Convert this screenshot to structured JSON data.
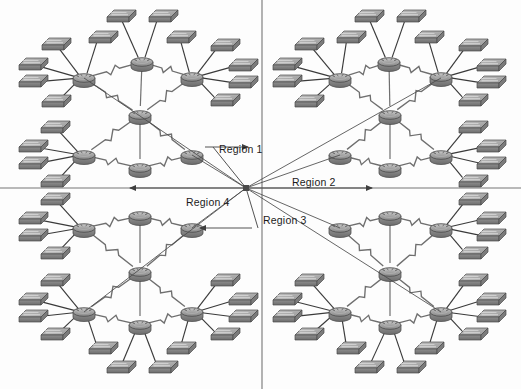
{
  "diagram": {
    "type": "network-topology",
    "width": 521,
    "height": 389,
    "background_color": "#fdfdfd",
    "colors": {
      "device_fill": "#8d8d8d",
      "device_fill_light": "#b4b4b4",
      "device_fill_dark": "#6e6e6e",
      "device_outline": "#4a4a4a",
      "lan_link": "#3a3a3a",
      "wan_link": "#6f6f6f",
      "divider": "#767676",
      "region_arrow": "#4a4a4a",
      "label_text": "#1b1b1b"
    },
    "dividers": {
      "vertical_x": 262,
      "horizontal_y": 188
    },
    "hub": {
      "x": 246,
      "y": 188
    }
  },
  "labels": {
    "region_1": "Region 1",
    "region_2": "Region 2",
    "region_3": "Region 3",
    "region_4": "Region 4"
  },
  "label_positions": [
    {
      "key": "region_1",
      "x": 219,
      "y": 150
    },
    {
      "key": "region_2",
      "x": 292,
      "y": 176
    },
    {
      "key": "region_3",
      "x": 263,
      "y": 214
    },
    {
      "key": "region_4",
      "x": 186,
      "y": 196
    }
  ],
  "region_leaders": [
    {
      "key": "region_1",
      "x1": 246,
      "y1": 188,
      "x2": 213,
      "y2": 147,
      "arrow_to": {
        "x": 246,
        "y": 147
      }
    },
    {
      "key": "region_2",
      "x1": 246,
      "y1": 188,
      "x2": 286,
      "y2": 188,
      "arrow_to": {
        "x": 368,
        "y": 188
      }
    },
    {
      "key": "region_3",
      "x1": 246,
      "y1": 188,
      "x2": 258,
      "y2": 228,
      "arrow_to": {
        "x": 256,
        "y": 228
      }
    },
    {
      "key": "region_4",
      "x1": 246,
      "y1": 188,
      "x2": 180,
      "y2": 188,
      "arrow_to": {
        "x": 180,
        "y": 188
      }
    }
  ],
  "icons": {
    "router": "router-icon",
    "switch": "switch-icon",
    "wan_link": "lightning-link-icon",
    "lan_link": "line-link-icon",
    "hub_node": "hub-node-icon",
    "arrow": "arrow-head-icon"
  },
  "legend_semantics": {
    "router": "Cisco router — flattened cylinder with arrows on top",
    "switch": "Cisco LAN switch — flat 3D box",
    "wan_link": "Serial / WAN connection drawn as a lightning bolt",
    "lan_link": "Ethernet LAN connection drawn as a straight line"
  },
  "regions": [
    {
      "id": "region_1",
      "name": "Region 1",
      "quadrant": "top-left",
      "router_count": 5,
      "switch_count": 14,
      "routers": [
        {
          "id": "r1-nw",
          "role": "edge",
          "x": 84,
          "y": 78
        },
        {
          "id": "r1-n",
          "role": "edge",
          "x": 142,
          "y": 62
        },
        {
          "id": "r1-ne",
          "role": "edge",
          "x": 192,
          "y": 77
        },
        {
          "id": "r1-c",
          "role": "core",
          "x": 140,
          "y": 115
        },
        {
          "id": "r1-sw",
          "role": "edge",
          "x": 84,
          "y": 155
        },
        {
          "id": "r1-s",
          "role": "edge",
          "x": 140,
          "y": 168
        },
        {
          "id": "r1-se",
          "role": "edge",
          "x": 192,
          "y": 155
        }
      ],
      "switches": [
        {
          "id": "s1-01",
          "x": 53,
          "y": 45
        },
        {
          "id": "s1-02",
          "x": 30,
          "y": 65
        },
        {
          "id": "s1-03",
          "x": 30,
          "y": 82
        },
        {
          "id": "s1-04",
          "x": 53,
          "y": 102
        },
        {
          "id": "s1-05",
          "x": 118,
          "y": 17
        },
        {
          "id": "s1-06",
          "x": 160,
          "y": 17
        },
        {
          "id": "s1-07",
          "x": 100,
          "y": 38
        },
        {
          "id": "s1-08",
          "x": 178,
          "y": 38
        },
        {
          "id": "s1-09",
          "x": 222,
          "y": 46
        },
        {
          "id": "s1-10",
          "x": 240,
          "y": 66
        },
        {
          "id": "s1-11",
          "x": 240,
          "y": 83
        },
        {
          "id": "s1-12",
          "x": 222,
          "y": 101
        },
        {
          "id": "s1-13",
          "x": 52,
          "y": 128
        },
        {
          "id": "s1-14",
          "x": 30,
          "y": 147
        },
        {
          "id": "s1-15",
          "x": 30,
          "y": 164
        },
        {
          "id": "s1-16",
          "x": 52,
          "y": 182
        }
      ]
    },
    {
      "id": "region_2",
      "name": "Region 2",
      "quadrant": "top-right",
      "router_count": 5,
      "switch_count": 14,
      "routers": [
        {
          "id": "r2-nw",
          "role": "edge",
          "x": 340,
          "y": 78
        },
        {
          "id": "r2-n",
          "role": "edge",
          "x": 389,
          "y": 62
        },
        {
          "id": "r2-ne",
          "role": "edge",
          "x": 441,
          "y": 77
        },
        {
          "id": "r2-c",
          "role": "core",
          "x": 390,
          "y": 115
        },
        {
          "id": "r2-sw",
          "role": "edge",
          "x": 340,
          "y": 155
        },
        {
          "id": "r2-s",
          "role": "edge",
          "x": 390,
          "y": 168
        },
        {
          "id": "r2-se",
          "role": "edge",
          "x": 441,
          "y": 155
        }
      ],
      "switches": [
        {
          "id": "s2-01",
          "x": 306,
          "y": 45
        },
        {
          "id": "s2-02",
          "x": 284,
          "y": 65
        },
        {
          "id": "s2-03",
          "x": 284,
          "y": 82
        },
        {
          "id": "s2-04",
          "x": 306,
          "y": 102
        },
        {
          "id": "s2-05",
          "x": 366,
          "y": 17
        },
        {
          "id": "s2-06",
          "x": 408,
          "y": 17
        },
        {
          "id": "s2-07",
          "x": 348,
          "y": 38
        },
        {
          "id": "s2-08",
          "x": 426,
          "y": 38
        },
        {
          "id": "s2-09",
          "x": 470,
          "y": 46
        },
        {
          "id": "s2-10",
          "x": 488,
          "y": 66
        },
        {
          "id": "s2-11",
          "x": 488,
          "y": 83
        },
        {
          "id": "s2-12",
          "x": 470,
          "y": 101
        },
        {
          "id": "s2-13",
          "x": 470,
          "y": 128
        },
        {
          "id": "s2-14",
          "x": 488,
          "y": 147
        },
        {
          "id": "s2-15",
          "x": 488,
          "y": 164
        },
        {
          "id": "s2-16",
          "x": 470,
          "y": 182
        }
      ]
    },
    {
      "id": "region_3",
      "name": "Region 3",
      "quadrant": "bottom-right",
      "router_count": 5,
      "switch_count": 14,
      "routers": [
        {
          "id": "r3-nw",
          "role": "edge",
          "x": 340,
          "y": 228
        },
        {
          "id": "r3-n",
          "role": "edge",
          "x": 390,
          "y": 216
        },
        {
          "id": "r3-ne",
          "role": "edge",
          "x": 441,
          "y": 228
        },
        {
          "id": "r3-c",
          "role": "core",
          "x": 390,
          "y": 272
        },
        {
          "id": "r3-sw",
          "role": "edge",
          "x": 340,
          "y": 312
        },
        {
          "id": "r3-s",
          "role": "edge",
          "x": 390,
          "y": 325
        },
        {
          "id": "r3-se",
          "role": "edge",
          "x": 441,
          "y": 312
        }
      ],
      "switches": [
        {
          "id": "s3-01",
          "x": 470,
          "y": 200
        },
        {
          "id": "s3-02",
          "x": 488,
          "y": 219
        },
        {
          "id": "s3-03",
          "x": 488,
          "y": 236
        },
        {
          "id": "s3-04",
          "x": 470,
          "y": 254
        },
        {
          "id": "s3-05",
          "x": 470,
          "y": 281
        },
        {
          "id": "s3-06",
          "x": 488,
          "y": 300
        },
        {
          "id": "s3-07",
          "x": 488,
          "y": 317
        },
        {
          "id": "s3-08",
          "x": 470,
          "y": 335
        },
        {
          "id": "s3-09",
          "x": 306,
          "y": 281
        },
        {
          "id": "s3-10",
          "x": 284,
          "y": 300
        },
        {
          "id": "s3-11",
          "x": 284,
          "y": 317
        },
        {
          "id": "s3-12",
          "x": 306,
          "y": 335
        },
        {
          "id": "s3-13",
          "x": 366,
          "y": 368
        },
        {
          "id": "s3-14",
          "x": 408,
          "y": 368
        },
        {
          "id": "s3-15",
          "x": 348,
          "y": 349
        },
        {
          "id": "s3-16",
          "x": 426,
          "y": 349
        }
      ]
    },
    {
      "id": "region_4",
      "name": "Region 4",
      "quadrant": "bottom-left",
      "router_count": 5,
      "switch_count": 14,
      "routers": [
        {
          "id": "r4-nw",
          "role": "edge",
          "x": 84,
          "y": 228
        },
        {
          "id": "r4-n",
          "role": "edge",
          "x": 140,
          "y": 216
        },
        {
          "id": "r4-ne",
          "role": "edge",
          "x": 192,
          "y": 228
        },
        {
          "id": "r4-c",
          "role": "core",
          "x": 140,
          "y": 272
        },
        {
          "id": "r4-sw",
          "role": "edge",
          "x": 84,
          "y": 312
        },
        {
          "id": "r4-s",
          "role": "edge",
          "x": 140,
          "y": 325
        },
        {
          "id": "r4-se",
          "role": "edge",
          "x": 192,
          "y": 312
        }
      ],
      "switches": [
        {
          "id": "s4-01",
          "x": 52,
          "y": 200
        },
        {
          "id": "s4-02",
          "x": 30,
          "y": 219
        },
        {
          "id": "s4-03",
          "x": 30,
          "y": 236
        },
        {
          "id": "s4-04",
          "x": 52,
          "y": 254
        },
        {
          "id": "s4-05",
          "x": 52,
          "y": 281
        },
        {
          "id": "s4-06",
          "x": 30,
          "y": 300
        },
        {
          "id": "s4-07",
          "x": 30,
          "y": 317
        },
        {
          "id": "s4-08",
          "x": 52,
          "y": 335
        },
        {
          "id": "s4-09",
          "x": 222,
          "y": 281
        },
        {
          "id": "s4-10",
          "x": 240,
          "y": 300
        },
        {
          "id": "s4-11",
          "x": 240,
          "y": 317
        },
        {
          "id": "s4-12",
          "x": 222,
          "y": 335
        },
        {
          "id": "s4-13",
          "x": 118,
          "y": 368
        },
        {
          "id": "s4-14",
          "x": 160,
          "y": 368
        },
        {
          "id": "s4-15",
          "x": 100,
          "y": 349
        },
        {
          "id": "s4-16",
          "x": 178,
          "y": 349
        }
      ]
    }
  ],
  "wan_links": [
    [
      "r1-nw",
      "r1-n"
    ],
    [
      "r1-n",
      "r1-ne"
    ],
    [
      "r1-nw",
      "r1-c"
    ],
    [
      "r1-ne",
      "r1-c"
    ],
    [
      "r1-c",
      "r1-sw"
    ],
    [
      "r1-c",
      "r1-se"
    ],
    [
      "r1-sw",
      "r1-s"
    ],
    [
      "r1-s",
      "r1-se"
    ],
    [
      "r1-n",
      "r1-c"
    ],
    [
      "r1-c",
      "r1-s"
    ],
    [
      "r2-nw",
      "r2-n"
    ],
    [
      "r2-n",
      "r2-ne"
    ],
    [
      "r2-nw",
      "r2-c"
    ],
    [
      "r2-ne",
      "r2-c"
    ],
    [
      "r2-c",
      "r2-sw"
    ],
    [
      "r2-c",
      "r2-se"
    ],
    [
      "r2-sw",
      "r2-s"
    ],
    [
      "r2-s",
      "r2-se"
    ],
    [
      "r2-n",
      "r2-c"
    ],
    [
      "r2-c",
      "r2-s"
    ],
    [
      "r3-nw",
      "r3-n"
    ],
    [
      "r3-n",
      "r3-ne"
    ],
    [
      "r3-nw",
      "r3-c"
    ],
    [
      "r3-ne",
      "r3-c"
    ],
    [
      "r3-c",
      "r3-sw"
    ],
    [
      "r3-c",
      "r3-se"
    ],
    [
      "r3-sw",
      "r3-s"
    ],
    [
      "r3-s",
      "r3-se"
    ],
    [
      "r3-n",
      "r3-c"
    ],
    [
      "r3-c",
      "r3-s"
    ],
    [
      "r4-nw",
      "r4-n"
    ],
    [
      "r4-n",
      "r4-ne"
    ],
    [
      "r4-nw",
      "r4-c"
    ],
    [
      "r4-ne",
      "r4-c"
    ],
    [
      "r4-c",
      "r4-sw"
    ],
    [
      "r4-c",
      "r4-se"
    ],
    [
      "r4-sw",
      "r4-s"
    ],
    [
      "r4-s",
      "r4-se"
    ],
    [
      "r4-n",
      "r4-c"
    ],
    [
      "r4-c",
      "r4-s"
    ]
  ]
}
